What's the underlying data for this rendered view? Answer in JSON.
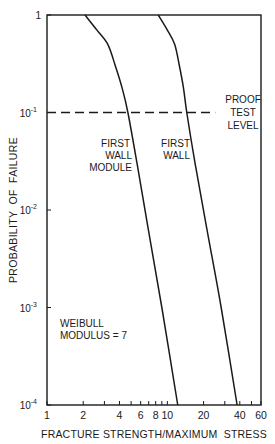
{
  "chart_data": {
    "type": "line",
    "title": "",
    "xlabel": "FRACTURE STRENGTH/MAXIMUM  STRESS",
    "ylabel": "PROBABILITY  OF  FAILURE",
    "xscale": "log",
    "yscale": "log",
    "xlim": [
      1,
      60
    ],
    "ylim": [
      0.0001,
      1
    ],
    "x_ticks": [
      1,
      2,
      3,
      4,
      5,
      6,
      7,
      8,
      9,
      10,
      20,
      30,
      40,
      50,
      60
    ],
    "x_tick_labels": [
      {
        "value": 1,
        "label": "1"
      },
      {
        "value": 2,
        "label": "2"
      },
      {
        "value": 4,
        "label": "4"
      },
      {
        "value": 6,
        "label": "6"
      },
      {
        "value": 8,
        "label": "8"
      },
      {
        "value": 10,
        "label": "10"
      },
      {
        "value": 20,
        "label": "20"
      },
      {
        "value": 40,
        "label": "40"
      },
      {
        "value": 60,
        "label": "60"
      }
    ],
    "y_tick_labels": [
      {
        "value": 1,
        "base": "1",
        "exp": ""
      },
      {
        "value": 0.1,
        "base": "10",
        "exp": "-1"
      },
      {
        "value": 0.01,
        "base": "10",
        "exp": "-2"
      },
      {
        "value": 0.001,
        "base": "10",
        "exp": "-3"
      },
      {
        "value": 0.0001,
        "base": "10",
        "exp": "-4"
      }
    ],
    "grid": false,
    "series": [
      {
        "name": "FIRST WALL MODULE",
        "x": [
          2.07,
          2.6,
          3.2,
          3.7,
          4.2,
          4.7,
          5.6,
          7.0,
          9.0,
          12.2
        ],
        "y": [
          1.0,
          0.7,
          0.5,
          0.3,
          0.18,
          0.1,
          0.03,
          0.006,
          0.001,
          0.0001
        ]
      },
      {
        "name": "FIRST WALL",
        "x": [
          8.4,
          10.0,
          11.5,
          12.6,
          13.6,
          14.5,
          17.0,
          21.5,
          28.0,
          38.0
        ],
        "y": [
          1.0,
          0.7,
          0.5,
          0.3,
          0.18,
          0.1,
          0.03,
          0.006,
          0.001,
          0.0001
        ]
      }
    ],
    "reference_lines": [
      {
        "name": "PROOF TEST LEVEL",
        "axis": "y",
        "value": 0.1,
        "style": "dashed",
        "x_start": 1,
        "x_end": 25
      }
    ],
    "annotations": [
      {
        "id": "proof",
        "lines": [
          "PROOF",
          "TEST",
          "LEVEL"
        ]
      },
      {
        "id": "fwm",
        "lines": [
          "FIRST",
          "WALL",
          "MODULE"
        ]
      },
      {
        "id": "fw",
        "lines": [
          "FIRST",
          "WALL"
        ]
      },
      {
        "id": "weibull",
        "lines": [
          "WEIBULL",
          "MODULUS = 7"
        ]
      }
    ],
    "legend": "none (inline labels)"
  }
}
